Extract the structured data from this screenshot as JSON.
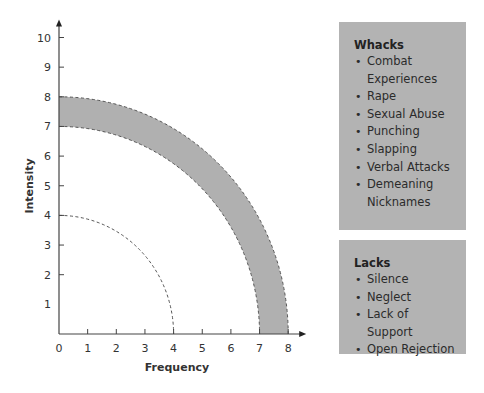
{
  "chart_data": {
    "type": "area",
    "title": "",
    "xlabel": "Frequency",
    "ylabel": "Intensity",
    "xlim": [
      0,
      8
    ],
    "ylim": [
      0,
      10
    ],
    "x_ticks": [
      "0",
      "1",
      "2",
      "3",
      "4",
      "5",
      "6",
      "7",
      "8"
    ],
    "y_ticks": [
      "1",
      "2",
      "3",
      "4",
      "5",
      "6",
      "7",
      "8",
      "9",
      "10"
    ],
    "grid": false,
    "series": [
      {
        "name": "inner-threshold",
        "kind": "dashed-quarter-arc",
        "radius": 4,
        "fill": "none"
      },
      {
        "name": "band-inner-edge",
        "kind": "dashed-quarter-arc",
        "radius": 7
      },
      {
        "name": "band-outer-edge",
        "kind": "dashed-quarter-arc",
        "radius": 8
      },
      {
        "name": "shaded-band",
        "kind": "annulus-fill",
        "inner_radius": 7,
        "outer_radius": 8,
        "color": "#b0b0b0"
      }
    ]
  },
  "legend": {
    "whacks": {
      "title": "Whacks",
      "items": [
        "Combat Experiences",
        "Rape",
        "Sexual Abuse",
        "Punching",
        "Slapping",
        "Verbal Attacks",
        "Demeaning Nicknames"
      ]
    },
    "lacks": {
      "title": "Lacks",
      "items": [
        "Silence",
        "Neglect",
        "Lack of Support",
        "Open Rejection"
      ]
    }
  },
  "colors": {
    "band": "#b0b0b0",
    "box": "#b3b3b3",
    "axis": "#444444"
  }
}
